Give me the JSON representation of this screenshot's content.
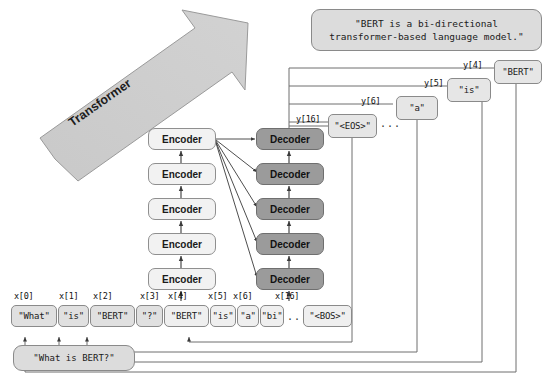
{
  "diagram": {
    "title_caption": "Transformer encoder-decoder sequence generation for BERT question answering",
    "transformer_arrow_label": "Transformer",
    "question_bubble": "\"What is BERT?\"",
    "answer_bubble": "\"BERT is a bi-directional\ntransformer-based language model.\"",
    "ellipsis": "..."
  },
  "encoder_stack": {
    "label": "Encoder",
    "count": 5,
    "blocks": [
      {
        "label": "Encoder"
      },
      {
        "label": "Encoder"
      },
      {
        "label": "Encoder"
      },
      {
        "label": "Encoder"
      },
      {
        "label": "Encoder"
      }
    ]
  },
  "decoder_stack": {
    "label": "Decoder",
    "count": 5,
    "blocks": [
      {
        "label": "Decoder"
      },
      {
        "label": "Decoder"
      },
      {
        "label": "Decoder"
      },
      {
        "label": "Decoder"
      },
      {
        "label": "Decoder"
      }
    ]
  },
  "input_tokens": [
    {
      "index": "x[0]",
      "text": "\"What\"",
      "shifted": false
    },
    {
      "index": "x[1]",
      "text": "\"is\"",
      "shifted": false
    },
    {
      "index": "x[2]",
      "text": "\"BERT\"",
      "shifted": false
    },
    {
      "index": "x[3]",
      "text": "\"?\"",
      "shifted": false
    },
    {
      "index": "x[4]",
      "text": "\"BERT\"",
      "shifted": true
    },
    {
      "index": "x[5]",
      "text": "\"is\"",
      "shifted": true
    },
    {
      "index": "x[6]",
      "text": "\"a\"",
      "shifted": true
    },
    {
      "index": "",
      "text": "\"bi\"",
      "shifted": true
    },
    {
      "index": "x[16]",
      "text": "\"<BOS>\"",
      "shifted": true
    }
  ],
  "output_tokens": [
    {
      "index": "y[16]",
      "text": "\"<EOS>\""
    },
    {
      "index": "y[6]",
      "text": "\"a\""
    },
    {
      "index": "y[5]",
      "text": "\"is\""
    },
    {
      "index": "y[4]",
      "text": "\"BERT\""
    }
  ],
  "colors": {
    "encoder_fill": "#f2f2f2",
    "decoder_fill": "#9b9b9b",
    "token_fill": "#e0e0e0",
    "bubble_fill": "#dcdcdc",
    "arrow_fill": "#c6c6c6",
    "stroke": "#8a8a8a",
    "wire": "#4a4a4a"
  }
}
